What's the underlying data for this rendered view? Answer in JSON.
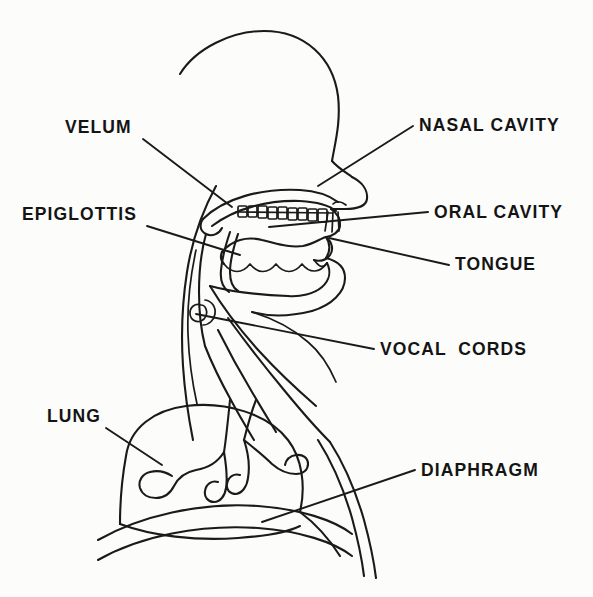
{
  "figure": {
    "style": "line-drawing",
    "background_color": "#fcfcfb",
    "ink_color": "#1a1a1a"
  },
  "labels": [
    {
      "id": "velum",
      "text": "VELUM",
      "text_x": 65,
      "text_y": 133,
      "anchor": "start",
      "leader": "M 143 139 L 232 207"
    },
    {
      "id": "epiglottis",
      "text": "EPIGLOTTIS",
      "text_x": 22,
      "text_y": 220,
      "anchor": "start",
      "leader": "M 147 226 L 240 255"
    },
    {
      "id": "lung",
      "text": "LUNG",
      "text_x": 47,
      "text_y": 422,
      "anchor": "start",
      "leader": "M 106 428 L 162 465"
    },
    {
      "id": "nasal-cavity",
      "text": "NASAL CAVITY",
      "text_x": 419,
      "text_y": 131,
      "anchor": "start",
      "leader": "M 413 126 L 318 186"
    },
    {
      "id": "oral-cavity",
      "text": "ORAL CAVITY",
      "text_x": 434,
      "text_y": 218,
      "anchor": "start",
      "leader": "M 428 212 L 269 227"
    },
    {
      "id": "tongue",
      "text": "TONGUE",
      "text_x": 455,
      "text_y": 270,
      "anchor": "start",
      "leader": "M 449 265 L 329 238"
    },
    {
      "id": "vocal-cords",
      "text": "VOCAL  CORDS",
      "text_x": 380,
      "text_y": 355,
      "anchor": "start",
      "leader": "M 374 349 L 196 314"
    },
    {
      "id": "diaphragm",
      "text": "DIAPHRAGM",
      "text_x": 421,
      "text_y": 476,
      "anchor": "start",
      "leader": "M 415 470 L 262 522"
    }
  ],
  "anatomy": {
    "cranium": "M 180 74 C 196 48 232 31 264 31 C 305 31 333 58 338 96 C 341 122 335 143 332 161",
    "forehead_nose_bridge": "M 332 161 C 337 167 345 172 352 177",
    "nose": "M 352 177 C 362 182 368 190 367 199 C 366 206 357 209 345 209 L 331 209",
    "nostril": "M 346 205 C 341 201 336 201 333 204",
    "upper_lip": "M 331 209 C 338 214 341 219 340 226 C 339 232 333 236 326 237",
    "lower_lip_chin": "M 326 258 C 338 261 345 268 345 278 C 345 292 332 305 312 311",
    "mouth_corner": "M 326 237 C 330 243 331 250 326 258",
    "face_under_jaw": "M 312 311 C 292 316 270 317 252 312",
    "palate_upper": "M 203 219 C 224 198 262 188 300 190 C 318 191 330 196 338 202",
    "palate_lower_curve": "M 212 226 C 236 208 268 200 300 201 C 318 202 330 206 336 211",
    "velum_hook": "M 203 219 C 199 225 200 231 206 234 C 212 237 219 234 222 228",
    "hard_palate_teeth_line": "M 236 212 L 332 213",
    "teeth_upper": [
      {
        "x": 238,
        "y": 206,
        "w": 9,
        "h": 11
      },
      {
        "x": 248,
        "y": 206,
        "w": 9,
        "h": 11
      },
      {
        "x": 258,
        "y": 206,
        "w": 9,
        "h": 12
      },
      {
        "x": 268,
        "y": 207,
        "w": 9,
        "h": 12
      },
      {
        "x": 278,
        "y": 207,
        "w": 9,
        "h": 12
      },
      {
        "x": 288,
        "y": 208,
        "w": 9,
        "h": 12
      },
      {
        "x": 298,
        "y": 208,
        "w": 9,
        "h": 12
      },
      {
        "x": 308,
        "y": 209,
        "w": 9,
        "h": 12
      },
      {
        "x": 318,
        "y": 209,
        "w": 9,
        "h": 13
      }
    ],
    "incisor_marks": "M 328 212 L 325 231 M 333 212 L 332 232 M 338 212 L 339 231",
    "tongue_top": "M 222 252 C 232 240 247 236 262 240 C 276 243 288 248 303 246 C 314 244 321 238 326 237",
    "tongue_tip": "M 326 237 C 332 242 334 249 330 255 C 327 260 320 262 314 260",
    "tongue_bottom_wave": "M 224 264 C 232 274 242 274 250 264 C 258 274 268 274 276 264 C 284 274 294 274 302 264 C 310 274 320 273 327 263",
    "tongue_left": "M 222 252 C 220 257 221 261 224 264",
    "tongue_root": "M 314 260 C 318 265 322 270 327 263",
    "lower_jaw_front": "M 327 263 C 331 271 330 280 322 287 C 314 294 300 297 288 296",
    "lower_jaw_floor": "M 288 296 C 262 295 232 292 210 286",
    "epiglottis_flap": "M 230 232 C 226 244 222 258 221 270 C 220 280 223 288 229 292",
    "epiglottis_inner": "M 238 234 C 234 246 230 260 230 272 C 230 281 233 288 238 291",
    "pharynx_back_wall": "M 206 234 C 201 252 199 272 199 292 C 199 312 201 330 205 346",
    "neck_back_outline": "M 216 186 C 203 210 192 240 187 272 C 182 304 181 336 183 366 C 185 396 189 420 193 440",
    "neck_back_inner": "M 196 250 C 190 278 187 306 188 334 C 189 362 193 386 197 404",
    "larynx_oval_outer": "M 201 305 C 195 303 190 307 190 313 C 190 319 195 323 201 321 C 206 319 208 313 206 309 C 205 306 203 305 201 305",
    "larynx_oval_inner": "M 205 300 C 212 301 216 307 215 314 C 214 320 209 325 203 325",
    "trachea_front": "M 205 346 C 212 364 222 384 232 402 C 240 417 248 430 254 440",
    "trachea_back": "M 218 330 C 228 350 240 372 252 392 C 262 409 270 422 276 432",
    "esophagus_line": "M 228 318 C 244 340 264 366 284 390 C 302 412 318 430 330 442",
    "throat_front_outer": "M 210 286 C 222 306 240 330 260 352 C 280 374 300 392 316 406",
    "lung_dome": "M 126 456 C 130 428 154 410 186 406 C 226 401 268 414 288 440 C 302 458 306 486 300 512",
    "lung_left_side": "M 126 456 C 122 478 120 502 120 524",
    "lung_bottom_line": "M 120 524 C 152 536 196 541 238 538 C 268 536 290 531 300 526",
    "bronchus_main": "M 230 400 C 228 420 226 440 224 452",
    "bronchi_tree": "M 224 452 C 218 462 208 468 196 470 C 186 472 178 478 174 486 C 170 494 164 498 156 498 C 148 498 142 494 140 488 C 138 481 142 474 150 472 C 158 470 166 472 172 476 M 224 452 C 226 464 228 476 226 488 C 225 496 220 502 214 502 C 208 502 204 497 205 491 C 206 484 212 480 218 482 M 244 440 C 248 452 250 466 248 478 C 247 487 242 493 236 494 C 230 494 226 490 227 484 C 228 477 234 473 240 475 M 244 440 C 254 448 264 456 272 464 C 280 471 288 474 296 474 C 303 474 308 470 308 464 C 308 458 303 454 296 455 C 290 456 286 460 285 465",
    "bronchus_stem_right": "M 244 440 C 248 424 252 410 256 400",
    "diaphragm_curve": "M 98 540 C 140 516 200 502 258 506 C 300 509 334 520 352 534",
    "torso_outer": "M 330 442 C 344 464 356 492 364 520 C 370 542 374 562 376 578",
    "torso_inner": "M 318 440 C 332 462 344 490 352 518 C 358 540 362 560 364 576",
    "torso_bottom": "M 98 560 C 140 536 200 524 258 528 C 300 531 334 542 352 556",
    "chest_right_edge": "M 300 512 C 316 524 330 540 340 556",
    "shoulder_line": "M 252 312 C 272 318 292 328 308 342 C 320 352 330 368 336 382"
  }
}
